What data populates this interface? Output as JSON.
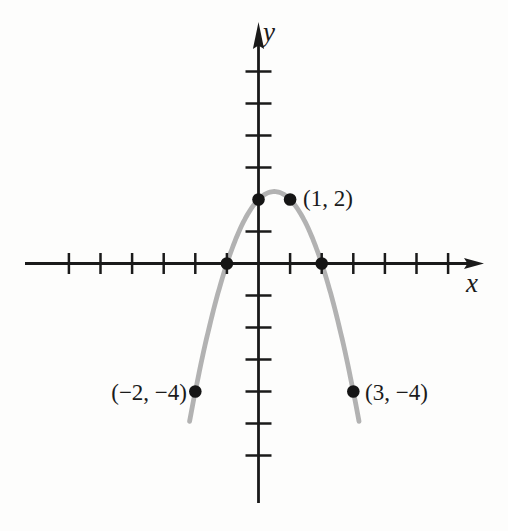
{
  "chart_data": {
    "type": "line",
    "subtype": "parabola",
    "title": "",
    "xlabel": "x",
    "ylabel": "y",
    "grid": false,
    "equation": "y = -(x + 1)(x - 2) = -x² + x + 2",
    "axis_color": "#1a1a1a",
    "point_color": "#151515",
    "x_ticks": [
      -6,
      -5,
      -4,
      -3,
      -2,
      -1,
      1,
      2,
      3,
      4,
      5,
      6
    ],
    "y_ticks": [
      -6,
      -5,
      -4,
      -3,
      -2,
      -1,
      1,
      3,
      4,
      5,
      6
    ],
    "x_axis_range_shown": [
      -7.4,
      7.1
    ],
    "y_axis_range_shown": [
      -7.5,
      7.6
    ],
    "curve": {
      "coefficients": {
        "a": -1,
        "b": 1,
        "c": 2
      },
      "x_min": -2.18,
      "x_max": 3.18,
      "color": "#b2b2b2"
    },
    "marked_points": [
      {
        "x": -1,
        "y": 0,
        "label": ""
      },
      {
        "x": 2,
        "y": 0,
        "label": ""
      },
      {
        "x": 0,
        "y": 2,
        "label": ""
      },
      {
        "x": 1,
        "y": 2,
        "label": "(1, 2)"
      },
      {
        "x": -2,
        "y": -4,
        "label": "(−2, −4)"
      },
      {
        "x": 3,
        "y": -4,
        "label": "(3, −4)"
      }
    ]
  }
}
